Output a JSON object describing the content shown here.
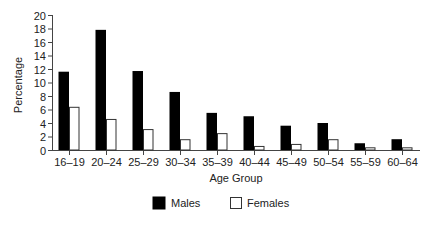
{
  "chart_data": {
    "type": "bar",
    "title": "",
    "xlabel": "Age Group",
    "ylabel": "Percentage",
    "ylim": [
      0,
      20
    ],
    "yticks": [
      0,
      2,
      4,
      6,
      8,
      10,
      12,
      14,
      16,
      18,
      20
    ],
    "grid": false,
    "legend_position": "bottom",
    "categories": [
      "16–19",
      "20–24",
      "25–29",
      "30–34",
      "35–39",
      "40–44",
      "45–49",
      "50–54",
      "55–59",
      "60–64"
    ],
    "series": [
      {
        "name": "Males",
        "color": "#000000",
        "values": [
          11.6,
          17.8,
          11.7,
          8.6,
          5.5,
          5.0,
          3.6,
          4.0,
          1.0,
          1.6
        ]
      },
      {
        "name": "Females",
        "color": "#ffffff",
        "values": [
          6.4,
          4.6,
          3.1,
          1.6,
          2.5,
          0.6,
          0.9,
          1.6,
          0.4,
          0.4
        ]
      }
    ]
  },
  "legend": {
    "males_label": "Males",
    "females_label": "Females"
  },
  "axes": {
    "x_title": "Age Group",
    "y_title": "Percentage"
  }
}
